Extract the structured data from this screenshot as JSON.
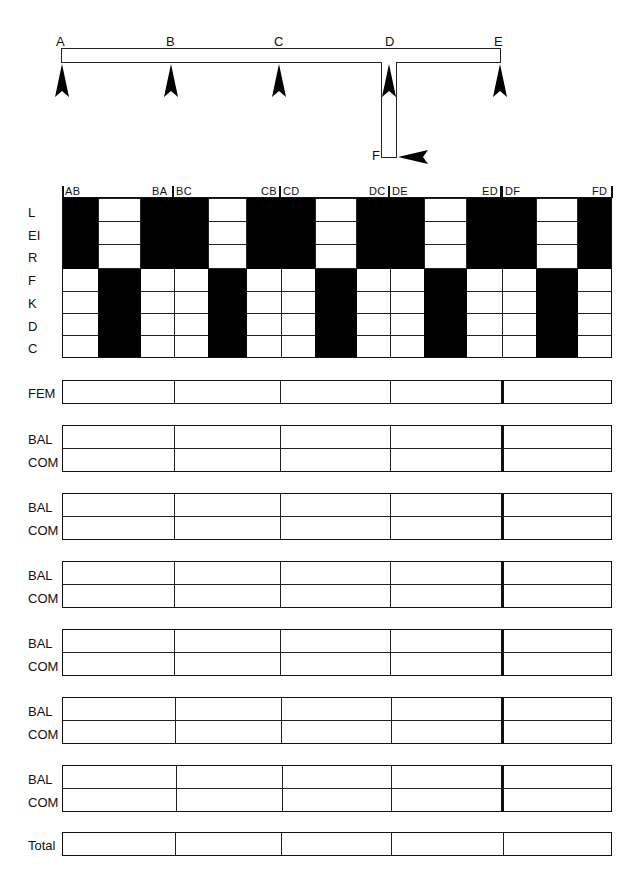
{
  "diagram": {
    "joints": [
      {
        "id": "A",
        "label": "A"
      },
      {
        "id": "B",
        "label": "B"
      },
      {
        "id": "C",
        "label": "C"
      },
      {
        "id": "D",
        "label": "D"
      },
      {
        "id": "E",
        "label": "E"
      },
      {
        "id": "F",
        "label": "F"
      }
    ]
  },
  "grid": {
    "row_labels": [
      "L",
      "EI",
      "R",
      "F",
      "K",
      "D",
      "C"
    ],
    "column_headers": [
      "AB",
      "BA",
      "BC",
      "CB",
      "CD",
      "DC",
      "DE",
      "ED",
      "DF",
      "FD"
    ]
  },
  "table": {
    "fem_label": "FEM",
    "groups": [
      {
        "bal": "BAL",
        "com": "COM"
      },
      {
        "bal": "BAL",
        "com": "COM"
      },
      {
        "bal": "BAL",
        "com": "COM"
      },
      {
        "bal": "BAL",
        "com": "COM"
      },
      {
        "bal": "BAL",
        "com": "COM"
      },
      {
        "bal": "BAL",
        "com": "COM"
      }
    ],
    "total_label": "Total"
  }
}
